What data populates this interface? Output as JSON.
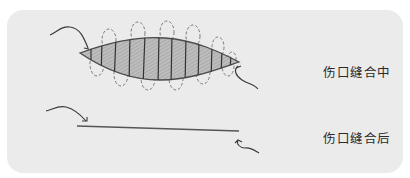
{
  "diagram": {
    "panel_background": "#ebebeb",
    "stroke_color": "#4a4a4a",
    "fill_color": "#b8b8b8",
    "stages": [
      {
        "id": "during",
        "label": "伤口缝合中",
        "depiction": "open-wound-with-running-suture"
      },
      {
        "id": "after",
        "label": "伤口缝合后",
        "depiction": "closed-wound-line"
      }
    ],
    "icons": {
      "thread_in": "curved-arrow-icon",
      "thread_out": "curved-arrow-icon"
    }
  }
}
